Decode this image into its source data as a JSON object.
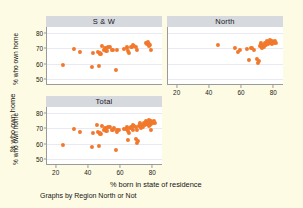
{
  "chart_data": {
    "type": "scatter",
    "title": "",
    "xlabel": "% born in state of residence",
    "ylabel": "% who own home",
    "note": "Graphs by Region North or Not",
    "xlim": [
      14,
      86
    ],
    "ylim": [
      46,
      84
    ],
    "xticks": [
      20,
      40,
      60,
      80
    ],
    "yticks": [
      50,
      60,
      70,
      80
    ],
    "grid": true,
    "grid_axis": "y",
    "marker_color": "#f2792c",
    "background_color": "#fdfbe4",
    "panel_title_color": "#d6d9de",
    "panel_layout": "2x2, bottom-right empty",
    "panels": [
      {
        "name": "S & W",
        "label": "S & W",
        "points": [
          [
            23.8,
            59.0
          ],
          [
            30.9,
            69.7
          ],
          [
            34.4,
            67.5
          ],
          [
            41.9,
            57.9
          ],
          [
            42.6,
            67.2
          ],
          [
            45.9,
            67.9
          ],
          [
            46.2,
            58.2
          ],
          [
            46.6,
            66.9
          ],
          [
            47.2,
            66.3
          ],
          [
            48.3,
            71.3
          ],
          [
            49.1,
            69.1
          ],
          [
            50.2,
            70.4
          ],
          [
            50.9,
            68.6
          ],
          [
            51.4,
            70.2
          ],
          [
            52.1,
            70.8
          ],
          [
            53.0,
            71.0
          ],
          [
            54.6,
            69.0
          ],
          [
            56.6,
            56.0
          ],
          [
            57.3,
            68.8
          ],
          [
            61.9,
            69.4
          ],
          [
            63.4,
            70.6
          ],
          [
            64.4,
            68.3
          ],
          [
            65.1,
            67.1
          ],
          [
            66.4,
            71.1
          ],
          [
            67.3,
            72.4
          ],
          [
            68.2,
            71.8
          ],
          [
            69.0,
            70.9
          ],
          [
            70.1,
            68.7
          ],
          [
            75.2,
            73.6
          ],
          [
            76.0,
            72.7
          ],
          [
            76.6,
            74.4
          ],
          [
            77.1,
            71.6
          ],
          [
            77.5,
            73.0
          ],
          [
            78.1,
            72.1
          ],
          [
            78.4,
            69.0
          ]
        ]
      },
      {
        "name": "North",
        "label": "North",
        "points": [
          [
            44.9,
            72.2
          ],
          [
            55.8,
            70.0
          ],
          [
            57.2,
            67.9
          ],
          [
            58.4,
            68.9
          ],
          [
            63.0,
            69.8
          ],
          [
            64.2,
            62.4
          ],
          [
            65.8,
            70.1
          ],
          [
            67.6,
            69.2
          ],
          [
            69.4,
            63.2
          ],
          [
            70.1,
            60.6
          ],
          [
            70.6,
            61.8
          ],
          [
            71.0,
            71.6
          ],
          [
            71.6,
            73.2
          ],
          [
            72.2,
            70.6
          ],
          [
            72.8,
            72.4
          ],
          [
            73.4,
            71.2
          ],
          [
            74.0,
            73.8
          ],
          [
            74.6,
            72.0
          ],
          [
            75.2,
            74.6
          ],
          [
            75.8,
            73.0
          ],
          [
            76.4,
            74.0
          ],
          [
            77.0,
            75.2
          ],
          [
            77.6,
            73.6
          ],
          [
            78.2,
            74.8
          ],
          [
            78.8,
            72.8
          ],
          [
            79.4,
            74.2
          ],
          [
            80.0,
            73.4
          ],
          [
            80.6,
            75.0
          ],
          [
            81.2,
            73.8
          ]
        ]
      },
      {
        "name": "Total",
        "label": "Total",
        "points": [
          [
            23.8,
            59.0
          ],
          [
            30.9,
            69.7
          ],
          [
            34.4,
            67.5
          ],
          [
            41.9,
            57.9
          ],
          [
            42.6,
            67.2
          ],
          [
            44.9,
            72.2
          ],
          [
            45.9,
            67.9
          ],
          [
            46.2,
            58.2
          ],
          [
            46.6,
            66.9
          ],
          [
            47.2,
            66.3
          ],
          [
            48.3,
            71.3
          ],
          [
            49.1,
            69.1
          ],
          [
            50.2,
            70.4
          ],
          [
            50.9,
            68.6
          ],
          [
            51.4,
            70.2
          ],
          [
            52.1,
            70.8
          ],
          [
            53.0,
            71.0
          ],
          [
            54.6,
            69.0
          ],
          [
            55.8,
            70.0
          ],
          [
            56.6,
            56.0
          ],
          [
            57.2,
            67.9
          ],
          [
            57.3,
            68.8
          ],
          [
            58.4,
            68.9
          ],
          [
            61.9,
            69.4
          ],
          [
            63.0,
            69.8
          ],
          [
            63.4,
            70.6
          ],
          [
            64.2,
            62.4
          ],
          [
            64.4,
            68.3
          ],
          [
            65.1,
            67.1
          ],
          [
            65.8,
            70.1
          ],
          [
            66.4,
            71.1
          ],
          [
            67.3,
            72.4
          ],
          [
            67.6,
            69.2
          ],
          [
            68.2,
            71.8
          ],
          [
            69.0,
            70.9
          ],
          [
            69.4,
            63.2
          ],
          [
            70.1,
            60.6
          ],
          [
            70.1,
            68.7
          ],
          [
            70.6,
            61.8
          ],
          [
            71.0,
            71.6
          ],
          [
            71.6,
            73.2
          ],
          [
            72.2,
            70.6
          ],
          [
            72.8,
            72.4
          ],
          [
            73.4,
            71.2
          ],
          [
            74.0,
            73.8
          ],
          [
            74.6,
            72.0
          ],
          [
            75.2,
            73.6
          ],
          [
            75.2,
            74.6
          ],
          [
            75.8,
            73.0
          ],
          [
            76.0,
            72.7
          ],
          [
            76.4,
            74.0
          ],
          [
            76.6,
            74.4
          ],
          [
            77.0,
            75.2
          ],
          [
            77.1,
            71.6
          ],
          [
            77.5,
            73.0
          ],
          [
            77.6,
            73.6
          ],
          [
            78.1,
            72.1
          ],
          [
            78.2,
            74.8
          ],
          [
            78.4,
            69.0
          ],
          [
            78.8,
            72.8
          ],
          [
            79.4,
            74.2
          ],
          [
            80.0,
            73.4
          ],
          [
            80.6,
            75.0
          ],
          [
            81.2,
            73.8
          ]
        ]
      }
    ]
  }
}
